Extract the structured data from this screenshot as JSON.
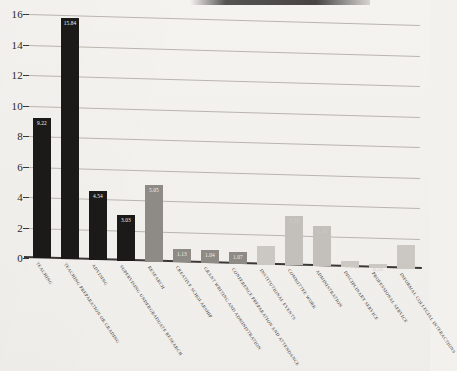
{
  "figure": {
    "background_color": "#f3f1ee",
    "paper_note": "scanned page, slightly skewed gridlines"
  },
  "chart_data": {
    "type": "bar",
    "title": "",
    "subtitle": "",
    "xlabel": "",
    "ylabel": "",
    "ylim": [
      0,
      16
    ],
    "ytick_labels": [
      "0",
      "2",
      "4",
      "6",
      "8",
      "10",
      "12",
      "14",
      "16"
    ],
    "ytick_values": [
      0,
      2,
      4,
      6,
      8,
      10,
      12,
      14,
      16
    ],
    "grid": true,
    "legend": "none",
    "legend_position": "none",
    "categories": [
      "TEACHING",
      "TEACHING PREPARATION OR GRADING",
      "ADVISING",
      "SUPERVISING UNDERGRADUATE RESEARCH",
      "RESEARCH",
      "CREATIVE SCHOLARSHIP",
      "GRANT WRITING AND ADMINISTRATION",
      "CONFERENCE PREPARATION AND ATTENDANCE",
      "INSTITUTIONAL EVENTS",
      "COMMITTEE WORK",
      "ADMINISTRATION",
      "DISCIPLINARY SERVICE",
      "PROFESSIONAL SERVICE",
      "INFORMAL COLLEGIAL INTERACTIONS"
    ],
    "values": [
      9.22,
      15.84,
      4.54,
      3.03,
      5.05,
      0.89,
      0.84,
      0.75,
      1.22,
      3.23,
      2.66,
      0.42,
      0.26,
      1.55
    ],
    "data_labels": [
      "9.22",
      "15.84",
      "4.54",
      "3.03",
      "5.05",
      "1.13",
      "1.04",
      "1.07",
      "1.25",
      "3.23",
      "2.14",
      "0.84",
      "0.53",
      ""
    ],
    "bar_colors": [
      "#1c1a18",
      "#1c1a18",
      "#1c1a18",
      "#1c1a18",
      "#8e8b86",
      "#8e8b86",
      "#8e8b86",
      "#8e8b86",
      "#cbc8c3",
      "#c3c0bb",
      "#c3c0bb",
      "#cbc8c3",
      "#cbc8c3",
      "#cbc8c3"
    ],
    "label_tone": [
      "dark",
      "dark",
      "dark",
      "dark",
      "mid",
      "mid",
      "mid",
      "mid",
      "light",
      "light",
      "light",
      "light",
      "light",
      "light"
    ],
    "accent_color": "#1c1a18",
    "grid_color": "#b9b4ae",
    "axis_color": "#3a3734"
  }
}
